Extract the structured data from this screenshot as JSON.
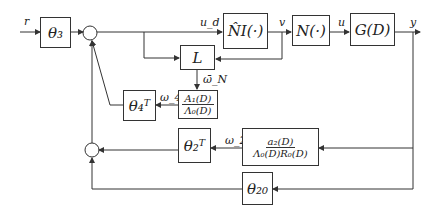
{
  "diagram": {
    "signals": {
      "r": "r",
      "u_d": "u_d",
      "v": "v",
      "u": "u",
      "y": "y",
      "omega_N": "ω̄_N",
      "omega_4": "ω_4",
      "omega_2": "ω_2"
    },
    "blocks": {
      "theta3": "θ₃",
      "NI_hat": "N̂I(·)",
      "N": "N(·)",
      "G": "G(D)",
      "L": "L",
      "A1_over_Lambda0": {
        "num": "A₁(D)",
        "den": "Λ₀(D)"
      },
      "theta4T": "θ₄ᵀ",
      "theta2T": "θ₂ᵀ",
      "a2_over_Lambda0R0": {
        "num": "a₂(D)",
        "den": "Λ₀(D)R₀(D)"
      },
      "theta20": "θ₂₀"
    },
    "colors": {
      "line": "#333333",
      "background": "#ffffff"
    }
  }
}
